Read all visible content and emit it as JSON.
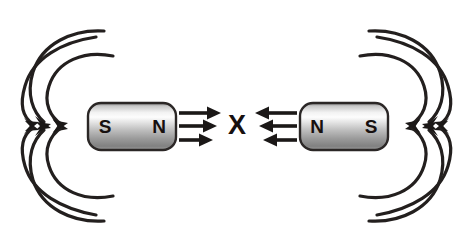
{
  "diagram": {
    "background_color": "#ffffff",
    "line_color": "#231f1e",
    "label_color": "#17100f"
  },
  "magnets": [
    {
      "id": "left-magnet",
      "left_pole_label": "S",
      "right_pole_label": "N",
      "body_color_light": "#fdfdfd",
      "body_color_mid": "#b9b9b9",
      "body_color_dark": "#6f6f6f",
      "outline_color": "#2b2726"
    },
    {
      "id": "right-magnet",
      "left_pole_label": "N",
      "right_pole_label": "S",
      "body_color_light": "#fdfdfd",
      "body_color_mid": "#b9b9b9",
      "body_color_dark": "#6f6f6f",
      "outline_color": "#2b2726"
    }
  ],
  "center": {
    "label": "X",
    "color": "#17100f"
  },
  "force_arrows": {
    "left_group": {
      "direction": "right",
      "count": 3,
      "color": "#1b1817"
    },
    "right_group": {
      "direction": "left",
      "count": 3,
      "color": "#1b1817"
    }
  },
  "field_lines": {
    "groups": [
      {
        "id": "upper-left",
        "count": 3,
        "arrow_direction": "toward-magnet-down-right"
      },
      {
        "id": "lower-left",
        "count": 3,
        "arrow_direction": "toward-magnet-up-right"
      },
      {
        "id": "upper-right",
        "count": 3,
        "arrow_direction": "toward-magnet-down-left"
      },
      {
        "id": "lower-right",
        "count": 3,
        "arrow_direction": "toward-magnet-up-left"
      }
    ],
    "color": "#231f1e"
  }
}
